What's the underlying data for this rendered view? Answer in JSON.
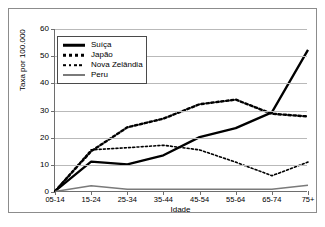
{
  "chart_data": {
    "type": "line",
    "title": "",
    "xlabel": "Idade",
    "ylabel": "Taxa por 100.000",
    "categories": [
      "05-14",
      "15-24",
      "25-34",
      "35-44",
      "45-54",
      "55-64",
      "65-74",
      "75+"
    ],
    "ylim": [
      0,
      60
    ],
    "yticks": [
      0,
      10,
      20,
      30,
      40,
      50,
      60
    ],
    "grid": true,
    "legend_position": "upper-left",
    "series": [
      {
        "name": "Suíça",
        "style": "solid-thick-black",
        "color": "#000000",
        "values": [
          0.3,
          11.2,
          10.2,
          13.5,
          20.2,
          23.5,
          29.3,
          52.3
        ]
      },
      {
        "name": "Japão",
        "style": "dotted-thick-black",
        "color": "#000000",
        "values": [
          0.3,
          15.0,
          23.8,
          27.0,
          32.3,
          34.0,
          28.8,
          27.8
        ]
      },
      {
        "name": "Nova Zelândia",
        "style": "dotted-thin-black",
        "color": "#000000",
        "values": [
          0.3,
          15.5,
          16.3,
          17.2,
          15.5,
          11.0,
          6.0,
          11.0
        ]
      },
      {
        "name": "Peru",
        "style": "solid-gray",
        "color": "#7a7a7a",
        "values": [
          0.2,
          2.3,
          1.0,
          1.0,
          1.0,
          1.0,
          1.0,
          2.5
        ]
      }
    ]
  },
  "axis": {
    "y_tick_labels": [
      "0",
      "10",
      "20",
      "30",
      "40",
      "50",
      "60"
    ],
    "x_tick_labels": [
      "05-14",
      "15-24",
      "25-34",
      "35-44",
      "45-54",
      "55-64",
      "65-74",
      "75+"
    ],
    "x_title": "Idade",
    "y_title": "Taxa por 100.000"
  },
  "legend": {
    "items": [
      {
        "label": "Suíça"
      },
      {
        "label": "Japão"
      },
      {
        "label": "Nova Zelândia"
      },
      {
        "label": "Peru"
      }
    ]
  }
}
